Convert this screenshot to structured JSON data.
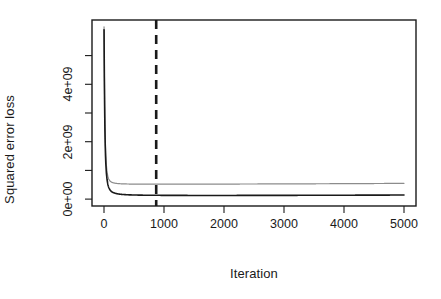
{
  "chart_data": {
    "type": "line",
    "title": "",
    "xlabel": "Iteration",
    "ylabel": "Squared error loss",
    "xlim": [
      0,
      5000
    ],
    "ylim": [
      0,
      6000000000
    ],
    "grid": false,
    "legend": "none",
    "x_ticks": [
      {
        "value": 0,
        "label": "0"
      },
      {
        "value": 1000,
        "label": "1000"
      },
      {
        "value": 2000,
        "label": "2000"
      },
      {
        "value": 3000,
        "label": "3000"
      },
      {
        "value": 4000,
        "label": "4000"
      },
      {
        "value": 5000,
        "label": "5000"
      }
    ],
    "y_ticks": [
      {
        "value": 0,
        "label": "0e+00"
      },
      {
        "value": 1000000000,
        "label": ""
      },
      {
        "value": 2000000000,
        "label": "2e+09"
      },
      {
        "value": 3000000000,
        "label": ""
      },
      {
        "value": 4000000000,
        "label": "4e+09"
      },
      {
        "value": 5000000000,
        "label": ""
      }
    ],
    "series": [
      {
        "name": "upper-loss-curve",
        "color": "#8c8c8c",
        "width": 1.2,
        "style": "solid",
        "x": [
          1,
          3,
          6,
          10,
          15,
          20,
          25,
          30,
          40,
          50,
          65,
          80,
          100,
          125,
          150,
          200,
          250,
          300,
          400,
          500,
          650,
          800,
          1000,
          1250,
          1500,
          2000,
          2500,
          3000,
          3500,
          4000,
          4500,
          5000
        ],
        "y": [
          6000000000,
          5300000000,
          4500000000,
          3600000000,
          2800000000,
          2250000000,
          1850000000,
          1560000000,
          1180000000,
          960000000,
          780000000,
          690000000,
          630000000,
          590000000,
          570000000,
          548000000,
          538000000,
          532000000,
          526000000,
          523000000,
          521000000,
          520000000,
          520000000,
          521000000,
          522000000,
          524000000,
          527000000,
          530000000,
          534000000,
          538000000,
          543000000,
          548000000
        ]
      },
      {
        "name": "lower-loss-curve",
        "color": "#1a1a1a",
        "width": 1.6,
        "style": "solid",
        "x": [
          1,
          3,
          6,
          10,
          15,
          20,
          25,
          30,
          40,
          50,
          65,
          80,
          100,
          125,
          150,
          200,
          250,
          300,
          400,
          500,
          650,
          800,
          1000,
          1250,
          1500,
          2000,
          2500,
          3000,
          3500,
          4000,
          4500,
          5000
        ],
        "y": [
          5900000000,
          5150000000,
          4250000000,
          3300000000,
          2450000000,
          1900000000,
          1520000000,
          1250000000,
          900000000,
          690000000,
          500000000,
          400000000,
          320000000,
          260000000,
          230000000,
          195000000,
          175000000,
          163000000,
          150000000,
          143000000,
          137000000,
          134000000,
          131000000,
          129000000,
          128000000,
          128000000,
          129000000,
          131000000,
          133000000,
          136000000,
          139000000,
          142000000
        ]
      }
    ],
    "annotations": [
      {
        "name": "selected-iteration-marker",
        "type": "vline",
        "x": 870,
        "color": "#1a1a1a",
        "style": "dashed",
        "width": 2.6,
        "dash": "9,6"
      }
    ],
    "plot_box": {
      "left": 92,
      "right": 416,
      "top": 20,
      "bottom": 206,
      "border_color": "#1a1a1a",
      "background": "#ffffff"
    }
  }
}
